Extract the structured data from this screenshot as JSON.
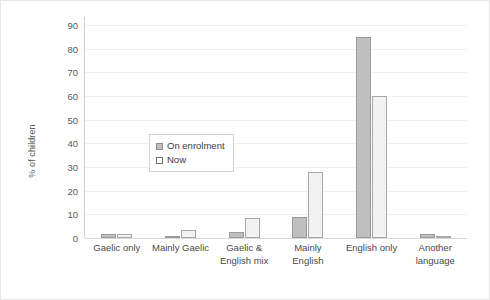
{
  "chart_data": {
    "type": "bar",
    "title": "",
    "xlabel": "",
    "ylabel": "% of children",
    "ylim": [
      0,
      90
    ],
    "yticks": [
      0,
      10,
      20,
      30,
      40,
      50,
      60,
      70,
      80,
      90
    ],
    "grid": true,
    "legend_position": "inside-upper-left",
    "categories": [
      "Gaelic only",
      "Mainly Gaelic",
      "Gaelic & English mix",
      "Mainly English",
      "English only",
      "Another language"
    ],
    "category_lines": [
      [
        "Gaelic only"
      ],
      [
        "Mainly Gaelic"
      ],
      [
        "Gaelic &",
        "English mix"
      ],
      [
        "Mainly",
        "English"
      ],
      [
        "English only"
      ],
      [
        "Another",
        "language"
      ]
    ],
    "series": [
      {
        "name": "On enrolment",
        "color": "#BFBFBF",
        "border_color": "#9A9A9A",
        "values": [
          1.8,
          0.6,
          2.5,
          9.0,
          85.0,
          1.5
        ]
      },
      {
        "name": "Now",
        "color": "#F2F2F2",
        "border_color": "#A8A8A8",
        "values": [
          1.5,
          3.4,
          8.4,
          28.0,
          60.0,
          0.6
        ]
      }
    ]
  },
  "axis": {
    "y_title": "% of children",
    "y_tick_labels": [
      "90",
      "80",
      "70",
      "60",
      "50",
      "40",
      "30",
      "20",
      "10",
      "0"
    ]
  },
  "legend": {
    "entries": [
      {
        "label": "On enrolment",
        "swatch": "filled-gray-square"
      },
      {
        "label": "Now",
        "swatch": "outlined-white-square"
      }
    ]
  },
  "colors": {
    "series_on_enrolment": "#BFBFBF",
    "series_now": "#F2F2F2",
    "gridline": "#F0F0F0",
    "axis": "#CFCFCF",
    "text": "#404040",
    "background": "#FFFFFF"
  }
}
